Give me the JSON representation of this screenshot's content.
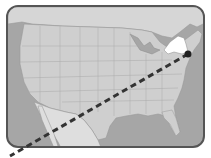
{
  "map": {
    "subject": "United States map",
    "highlighted_region": "New York",
    "colors": {
      "ocean": "#a6a6a6",
      "land": "#cfcfcf",
      "mexico": "#dedede",
      "highlight": "#ffffff",
      "borders": "#9a9a9a",
      "frame": "#555555",
      "route_line": "#333333",
      "marker": "#222222"
    },
    "route": {
      "style": "dashed",
      "start": {
        "x": 188,
        "y": 54
      },
      "end": {
        "x": 10,
        "y": 156
      }
    },
    "marker": {
      "x": 188,
      "y": 54,
      "label": ""
    }
  }
}
